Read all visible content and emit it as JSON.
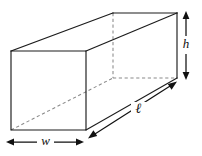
{
  "figure": {
    "background_color": "#ffffff",
    "solid_edge_color": "#1c1c1c",
    "hidden_edge_color": "#8a8a8a",
    "dimension_color": "#111111"
  },
  "labels": {
    "height": "h",
    "length": "ℓ",
    "width": "w"
  },
  "geometry": {
    "front_face": {
      "top_left": [
        11,
        51
      ],
      "top_right": [
        86,
        51
      ],
      "bottom_right": [
        86,
        130
      ],
      "bottom_left": [
        11,
        130
      ]
    },
    "back_face": {
      "top_left": [
        113,
        13
      ],
      "top_right": [
        177,
        13
      ],
      "bottom_right": [
        177,
        78
      ],
      "bottom_left": [
        113,
        78
      ]
    },
    "solid_edges": [
      "front-top",
      "front-right",
      "front-bottom",
      "front-left",
      "top-left-connector",
      "top-right-connector",
      "back-top",
      "back-right-vertical",
      "bottom-right-connector"
    ],
    "hidden_edges": [
      "back-left-vertical",
      "back-bottom",
      "bottom-left-diagonal"
    ]
  },
  "dimensions": {
    "height_arrow": {
      "name": "h",
      "orientation": "vertical",
      "x": 186,
      "y_start": 13,
      "y_end": 78,
      "label_position": [
        186,
        45
      ]
    },
    "length_arrow": {
      "name": "ℓ",
      "orientation": "diagonal",
      "start": [
        90,
        137
      ],
      "end": [
        175,
        83
      ],
      "label_position": [
        138,
        110
      ]
    },
    "width_arrow": {
      "name": "w",
      "orientation": "horizontal",
      "y": 142,
      "x_start": 8,
      "x_end": 82,
      "label_position": [
        45,
        142
      ]
    }
  }
}
